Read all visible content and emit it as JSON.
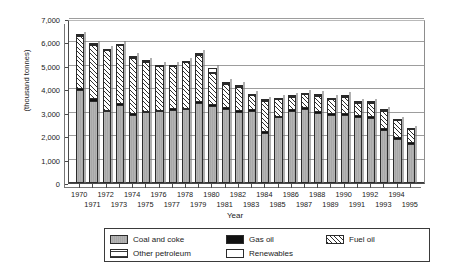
{
  "chart_data": {
    "type": "bar",
    "subtype": "stacked-column",
    "title": "",
    "xlabel": "Year",
    "ylabel": "(thousand tonnes)",
    "ylim": [
      0,
      7000
    ],
    "ytick_step": 1000,
    "ytick_labels": [
      "7,000",
      "6,000",
      "5,000",
      "4,000",
      "3,000",
      "2,000",
      "1,000",
      "0"
    ],
    "ytick_values": [
      7000,
      6000,
      5000,
      4000,
      3000,
      2000,
      1000,
      0
    ],
    "grid": true,
    "legend_position": "bottom",
    "categories": [
      "1970",
      "1971",
      "1972",
      "1973",
      "1974",
      "1975",
      "1976",
      "1977",
      "1978",
      "1979",
      "1980",
      "1981",
      "1982",
      "1983",
      "1984",
      "1985",
      "1986",
      "1987",
      "1988",
      "1989",
      "1990",
      "1991",
      "1992",
      "1993",
      "1994",
      "1995"
    ],
    "series": [
      {
        "name": "Coal and coke",
        "pattern": "solid-grey",
        "color": "#adadad",
        "values": [
          3950,
          3520,
          3060,
          3320,
          2920,
          3020,
          3060,
          3120,
          3150,
          3420,
          3300,
          3180,
          3040,
          3080,
          2150,
          2800,
          3080,
          3180,
          2980,
          2900,
          2900,
          2820,
          2760,
          2250,
          1900,
          1660
        ]
      },
      {
        "name": "Gas oil",
        "pattern": "solid-black",
        "color": "#111111",
        "values": [
          150,
          130,
          100,
          120,
          110,
          100,
          100,
          100,
          100,
          110,
          110,
          100,
          100,
          100,
          100,
          110,
          110,
          110,
          110,
          110,
          110,
          110,
          110,
          110,
          110,
          110
        ]
      },
      {
        "name": "Fuel oil",
        "pattern": "diagonal-hatch",
        "color": "#ffffff",
        "values": [
          2250,
          2300,
          2560,
          2500,
          2380,
          2120,
          1900,
          1830,
          1980,
          1980,
          1330,
          990,
          1000,
          620,
          1330,
          720,
          560,
          570,
          700,
          620,
          730,
          560,
          610,
          790,
          740,
          580
        ]
      },
      {
        "name": "Other petroleum",
        "pattern": "grid-hatch",
        "color": "#ffffff",
        "values": [
          60,
          60,
          60,
          60,
          60,
          60,
          60,
          60,
          50,
          70,
          100,
          70,
          70,
          60,
          60,
          60,
          60,
          60,
          60,
          60,
          60,
          60,
          60,
          60,
          40,
          40
        ]
      },
      {
        "name": "Renewables",
        "pattern": "empty-white",
        "color": "#ffffff",
        "values": [
          40,
          70,
          60,
          70,
          60,
          50,
          50,
          40,
          60,
          110,
          180,
          110,
          100,
          80,
          50,
          50,
          50,
          60,
          70,
          70,
          70,
          50,
          60,
          50,
          40,
          40
        ]
      }
    ],
    "totals": [
      6450,
      6080,
      5840,
      6070,
      5530,
      5350,
      5170,
      5150,
      5340,
      5690,
      5020,
      4450,
      4310,
      3940,
      3690,
      3740,
      3860,
      3980,
      3920,
      3760,
      3870,
      3600,
      3600,
      3260,
      2830,
      2430
    ]
  },
  "legend": {
    "entries": [
      {
        "label": "Coal and coke",
        "swatch": "swatch-coal-and-coke"
      },
      {
        "label": "Gas oil",
        "swatch": "swatch-gas-oil"
      },
      {
        "label": "Fuel oil",
        "swatch": "swatch-fuel-oil"
      },
      {
        "label": "Other petroleum",
        "swatch": "swatch-other-petroleum"
      },
      {
        "label": "Renewables",
        "swatch": "swatch-renewables"
      }
    ]
  }
}
